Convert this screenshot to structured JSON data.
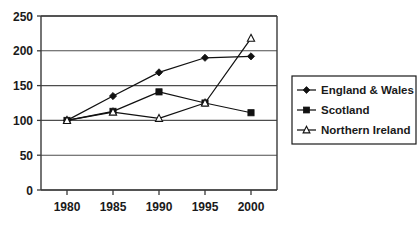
{
  "chart_data": {
    "type": "line",
    "title": "",
    "subtitle": "",
    "xlabel": "",
    "ylabel": "",
    "x": [
      1980,
      1985,
      1990,
      1995,
      2000
    ],
    "categories": [
      "1980",
      "1985",
      "1990",
      "1995",
      "2000"
    ],
    "xtick_labels": [
      "1980",
      "1985",
      "1990",
      "1995",
      "2000"
    ],
    "ytick_labels": [
      "0",
      "50",
      "100",
      "150",
      "200",
      "250"
    ],
    "ytick_values": [
      0,
      50,
      100,
      150,
      200,
      250
    ],
    "xlim": [
      1977.5,
      2002.5
    ],
    "ylim": [
      0,
      250
    ],
    "grid": "horizontal",
    "legend_position": "right",
    "series": [
      {
        "name": "England & Wales",
        "marker": "filled-diamond",
        "color": "#111111",
        "values": [
          100,
          135,
          169,
          190,
          192
        ]
      },
      {
        "name": "Scotland",
        "marker": "filled-square",
        "color": "#111111",
        "values": [
          100,
          113,
          141,
          125,
          111
        ]
      },
      {
        "name": "Northern Ireland",
        "marker": "open-triangle",
        "color": "#111111",
        "values": [
          100,
          112,
          103,
          125,
          218
        ]
      }
    ]
  },
  "legend": {
    "items": [
      {
        "label": "England & Wales",
        "marker": "filled-diamond"
      },
      {
        "label": "Scotland",
        "marker": "filled-square"
      },
      {
        "label": "Northern Ireland",
        "marker": "open-triangle"
      }
    ]
  },
  "axes": {
    "y": {
      "labels": [
        "250",
        "200",
        "150",
        "100",
        "50",
        "0"
      ]
    },
    "x": {
      "labels": [
        "1980",
        "1985",
        "1990",
        "1995",
        "2000"
      ]
    }
  },
  "colors": {
    "background": "#ffffff",
    "axis": "#3a3a3a",
    "grid": "#4d4d4d",
    "series": "#111111",
    "text": "#1a1a1a",
    "legend_border": "#1a1a1a"
  }
}
